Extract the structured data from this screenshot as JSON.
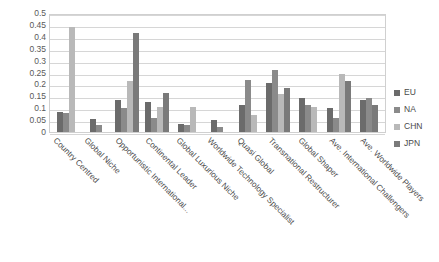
{
  "chart_data": {
    "type": "bar",
    "title": "",
    "subtitle": "",
    "xlabel": "",
    "ylabel": "",
    "ylim": [
      0,
      0.5
    ],
    "ytick_labels": [
      "0.5",
      "0.45",
      "0.4",
      "0.35",
      "0.3",
      "0.25",
      "0.2",
      "0.15",
      "0.1",
      "0.05",
      "0"
    ],
    "ytick_values": [
      0.5,
      0.45,
      0.4,
      0.35,
      0.3,
      0.25,
      0.2,
      0.15,
      0.1,
      0.05,
      0
    ],
    "grid": true,
    "grid_axis": "y",
    "legend_position": "right",
    "categories": [
      "Country Centred",
      "Global Niche",
      "Opportunistic International...",
      "Continental Leader",
      "Global Luxurious Niche",
      "Worldwide Technology Specialist",
      "Quasi Global",
      "Transnational Restructurer",
      "Global Shaper",
      "Ave. International Challengers",
      "Ave. Worldwide Players"
    ],
    "series": [
      {
        "name": "EU",
        "color": "#6b6b6b",
        "values": [
          0.085,
          0.055,
          0.135,
          0.125,
          0.035,
          0.05,
          0.115,
          0.205,
          0.145,
          0.1,
          0.135
        ]
      },
      {
        "name": "NA",
        "color": "#8a8a8a",
        "values": [
          0.08,
          0.03,
          0.1,
          0.06,
          0.03,
          0.02,
          0.22,
          0.26,
          0.115,
          0.06,
          0.145
        ]
      },
      {
        "name": "CHN",
        "color": "#b9b9b9",
        "values": [
          0.44,
          0.0,
          0.215,
          0.105,
          0.105,
          0.0,
          0.07,
          0.16,
          0.105,
          0.245,
          0.0
        ]
      },
      {
        "name": "JPN",
        "color": "#7a7a7a",
        "values": [
          0.0,
          0.0,
          0.415,
          0.165,
          0.0,
          0.0,
          0.0,
          0.185,
          0.0,
          0.215,
          0.115
        ]
      }
    ]
  },
  "legend": {
    "items": [
      {
        "label": "EU"
      },
      {
        "label": "NA"
      },
      {
        "label": "CHN"
      },
      {
        "label": "JPN"
      }
    ]
  }
}
